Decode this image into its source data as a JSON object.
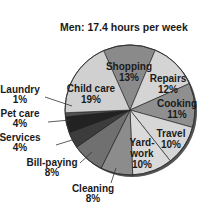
{
  "chart_data": {
    "type": "pie",
    "title": "Men: 17.4 hours per week",
    "categories": [
      "Shopping",
      "Repairs",
      "Cooking",
      "Travel",
      "Yard-work",
      "Cleaning",
      "Bill-paying",
      "Services",
      "Pet care",
      "Laundry",
      "Child care"
    ],
    "values": [
      13,
      12,
      11,
      10,
      10,
      8,
      8,
      4,
      4,
      1,
      19
    ],
    "labels": [
      "13%",
      "12%",
      "11%",
      "10%",
      "10%",
      "8%",
      "8%",
      "4%",
      "4%",
      "1%",
      "19%"
    ],
    "colors": [
      "#8a8a8a",
      "#d4d4d4",
      "#8f8f8f",
      "#d6d6d6",
      "#dadada",
      "#8c8c8c",
      "#707070",
      "#3c3c3c",
      "#222222",
      "#505050",
      "#d0d0d0"
    ],
    "start_angle_deg": -24,
    "direction": "clockwise",
    "legend": "none (external labels with leader lines)"
  }
}
